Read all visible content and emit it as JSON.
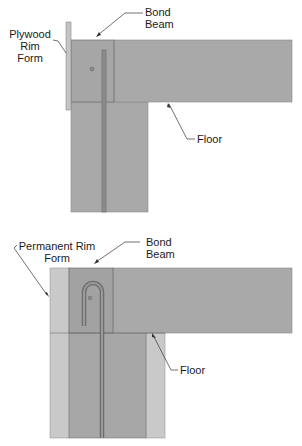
{
  "diagrams": [
    {
      "id": "top",
      "labels": {
        "rim_form_line1": "Plywood",
        "rim_form_line2": "Rim Form",
        "bond_beam_line1": "Bond",
        "bond_beam_line2": "Beam",
        "floor": "Floor"
      }
    },
    {
      "id": "bottom",
      "labels": {
        "rim_form_line1": "Permanent Rim",
        "rim_form_line2": "Form",
        "bond_beam_line1": "Bond",
        "bond_beam_line2": "Beam",
        "floor": "Floor"
      }
    }
  ],
  "colors": {
    "concrete": "#a9a9a9",
    "concrete_dark": "#9e9e9e",
    "form_light": "#c8c8c8",
    "rebar": "#7a7a7a",
    "edge": "#6e6e6e",
    "leader": "#333333"
  }
}
